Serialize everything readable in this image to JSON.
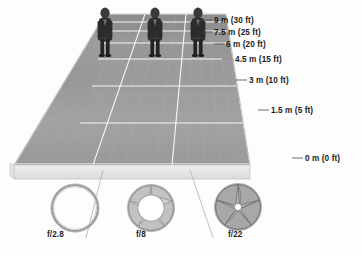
{
  "diagram": {
    "background_color": "#fdfdfd",
    "plane": {
      "surface_color": "#9b9b9b",
      "surface_color_light": "#adadad",
      "surface_color_dark": "#8b8b8b",
      "gridline_color": "#f2f2f2",
      "edge_face_color": "#e8e8e8",
      "edge_line_color": "#b9b9b9"
    },
    "figures": [
      {
        "name": "person-left",
        "label": "standing person"
      },
      {
        "name": "person-center",
        "label": "standing person"
      },
      {
        "name": "person-right",
        "label": "standing person"
      }
    ],
    "figure_colors": {
      "suit": "#2b2b2b",
      "head": "#3a3a3a",
      "shirt": "#6e6e6e"
    },
    "distance_labels": [
      {
        "text": "9 m (30 ft)",
        "x": 214,
        "y": 17
      },
      {
        "text": "7.5 m (25 ft)",
        "x": 214,
        "y": 29
      },
      {
        "text": "6 m (20 ft)",
        "x": 226,
        "y": 41
      },
      {
        "text": "4.5 m (15 ft)",
        "x": 235,
        "y": 56
      },
      {
        "text": "3 m (10 ft)",
        "x": 249,
        "y": 77
      },
      {
        "text": "1.5 m (5 ft)",
        "x": 271,
        "y": 107
      },
      {
        "text": "0 m (0 ft)",
        "x": 305,
        "y": 155
      }
    ],
    "apertures": [
      {
        "name": "aperture-f28",
        "label": "f/2.8",
        "cx": 75,
        "cy": 208,
        "r": 23,
        "opening": 0.93,
        "blades_visible": false,
        "label_x": 47,
        "label_y": 231
      },
      {
        "name": "aperture-f8",
        "label": "f/8",
        "cx": 151,
        "cy": 208,
        "r": 23,
        "opening": 0.62,
        "blades_visible": true,
        "label_x": 136,
        "label_y": 231
      },
      {
        "name": "aperture-f22",
        "label": "f/22",
        "cx": 238,
        "cy": 207,
        "r": 23,
        "opening": 0.16,
        "blades_visible": true,
        "label_x": 228,
        "label_y": 231
      }
    ],
    "aperture_colors": {
      "ring_outer": "#8f8f8f",
      "ring_inner": "#c9c9c9",
      "blade_fill": "#a9a9a9",
      "blade_stroke": "#7d7d7d",
      "opening_fill": "#ffffff"
    },
    "leader_lines": [
      {
        "name": "leader-f8",
        "x1": 103,
        "y1": 170,
        "x2": 86,
        "y2": 238
      },
      {
        "name": "leader-f22",
        "x1": 190,
        "y1": 170,
        "x2": 213,
        "y2": 238
      }
    ],
    "tick_color": "#4a4a4a"
  }
}
